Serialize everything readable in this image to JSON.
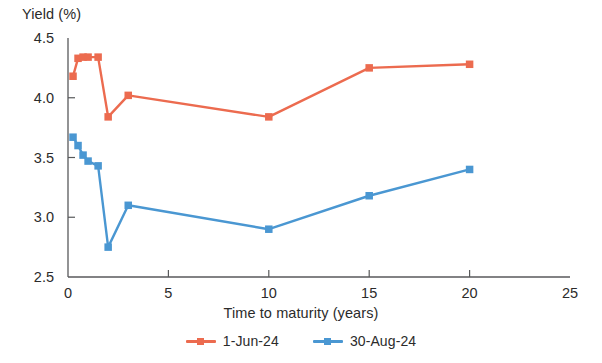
{
  "chart_data": {
    "type": "line",
    "title": "",
    "xlabel": "Time to maturity (years)",
    "ylabel": "Yield (%)",
    "xlim": [
      0,
      25
    ],
    "ylim": [
      2.5,
      4.5
    ],
    "xticks": [
      "0",
      "5",
      "10",
      "15",
      "20",
      "25"
    ],
    "xtick_values": [
      0,
      5,
      10,
      15,
      20,
      25
    ],
    "yticks": [
      "2.5",
      "3.0",
      "3.5",
      "4.0",
      "4.5"
    ],
    "ytick_values": [
      2.5,
      3.0,
      3.5,
      4.0,
      4.5
    ],
    "grid": false,
    "legend_position": "bottom-center",
    "series": [
      {
        "name": "1-Jun-24",
        "color": "#ec6b4f",
        "marker": "square",
        "x": [
          0.25,
          0.5,
          0.75,
          1.0,
          1.5,
          2.0,
          3.0,
          10.0,
          15.0,
          20.0
        ],
        "values": [
          4.18,
          4.33,
          4.34,
          4.34,
          4.34,
          3.84,
          4.02,
          3.84,
          4.25,
          4.28
        ]
      },
      {
        "name": "30-Aug-24",
        "color": "#4a97d2",
        "marker": "square",
        "x": [
          0.25,
          0.5,
          0.75,
          1.0,
          1.5,
          2.0,
          3.0,
          10.0,
          15.0,
          20.0
        ],
        "values": [
          3.67,
          3.6,
          3.52,
          3.47,
          3.43,
          2.75,
          3.1,
          2.9,
          3.18,
          3.4
        ]
      }
    ]
  },
  "axes": {
    "y_title": "Yield (%)",
    "x_title": "Time to maturity (years)"
  },
  "legend": {
    "entries": [
      {
        "label": "1-Jun-24",
        "color": "#ec6b4f"
      },
      {
        "label": "30-Aug-24",
        "color": "#4a97d2"
      }
    ]
  }
}
